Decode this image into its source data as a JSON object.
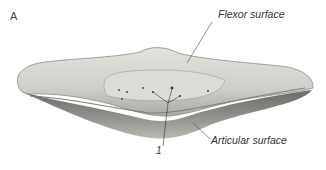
{
  "figure": {
    "panel_label": "A",
    "labels": {
      "flexor": "Flexor surface",
      "articular": "Articular surface",
      "numbered": "1"
    }
  }
}
